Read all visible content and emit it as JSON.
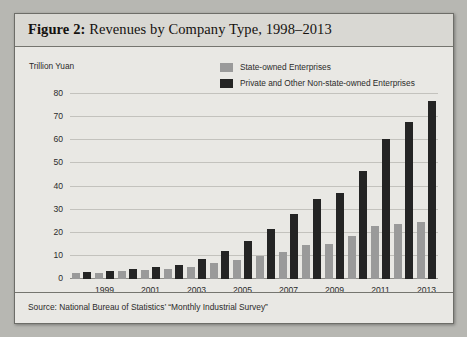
{
  "figure": {
    "label": "Figure 2:",
    "title": "Revenues by Company Type, 1998–2013",
    "source": "Source: National Bureau of Statistics’ “Monthly Industrial Survey”",
    "unit_label": "Trillion Yuan"
  },
  "colors": {
    "state_owned": "#9a9a9a",
    "private": "#242424",
    "panel_background": "#e9e8e4",
    "title_background": "#d9d8d3",
    "border": "#6d6d68",
    "gridline": "#c3c2bd",
    "text": "#2b2b2b"
  },
  "chart_data": {
    "type": "bar",
    "title": "Revenues by Company Type, 1998–2013",
    "xlabel": "",
    "ylabel": "Trillion Yuan",
    "ylim": [
      0,
      80
    ],
    "yticks": [
      0,
      10,
      20,
      30,
      40,
      50,
      60,
      70,
      80
    ],
    "grid": true,
    "legend_position": "top-right",
    "categories": [
      "1998",
      "1999",
      "2000",
      "2001",
      "2002",
      "2003",
      "2004",
      "2005",
      "2006",
      "2007",
      "2008",
      "2009",
      "2010",
      "2011",
      "2012",
      "2013"
    ],
    "tick_labels": [
      "",
      "1999",
      "",
      "2001",
      "",
      "2003",
      "",
      "2005",
      "",
      "2007",
      "",
      "2009",
      "",
      "2011",
      "",
      "2013"
    ],
    "series": [
      {
        "name": "State-owned Enterprises",
        "color": "#9a9a9a",
        "values": [
          2.6,
          2.8,
          3.5,
          3.8,
          4.2,
          5.3,
          7.0,
          8.3,
          10.0,
          11.7,
          14.8,
          15.0,
          18.8,
          23.0,
          23.8,
          24.8
        ]
      },
      {
        "name": "Private and Other Non-state-owned Enterprises",
        "color": "#242424",
        "values": [
          3.0,
          3.3,
          4.4,
          5.0,
          6.1,
          8.7,
          12.3,
          16.5,
          21.5,
          28.0,
          34.5,
          37.0,
          46.5,
          60.5,
          68.0,
          77.0
        ]
      }
    ]
  }
}
